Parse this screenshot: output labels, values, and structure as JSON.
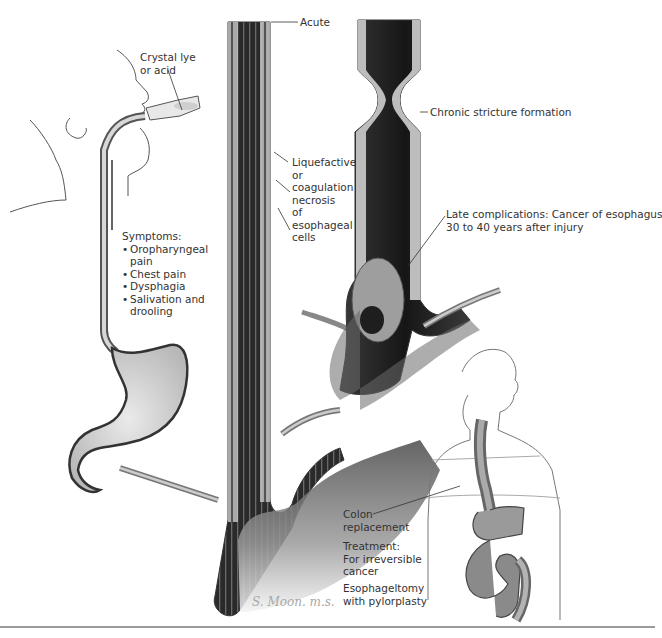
{
  "figure": {
    "labels": {
      "agent": [
        "Crystal lye",
        "or acid"
      ],
      "symptoms_title": "Symptoms:",
      "symptoms": [
        [
          "Oropharyngeal",
          "pain"
        ],
        [
          "Chest pain"
        ],
        [
          "Dysphagia"
        ],
        [
          "Salivation and",
          "drooling"
        ]
      ],
      "acute": "Acute",
      "necrosis": [
        "Liquefactive",
        "or",
        "coagulation",
        "necrosis",
        "of",
        "esophageal",
        "cells"
      ],
      "chronic": "Chronic stricture formation",
      "late": [
        "Late complications: Cancer of esophagus",
        "30 to 40 years after injury"
      ],
      "colon": [
        "Colon",
        "replacement"
      ],
      "treatment": [
        "Treatment:",
        "For irreversible",
        "cancer"
      ],
      "surgery": [
        "Esophageltomy",
        "with pylorplasty"
      ]
    },
    "signature": "S. Moon. m.s.",
    "colors": {
      "ink": "#2a2a2a",
      "tissue_dark": "#3a3a3a",
      "tissue_mid": "#8a8a8a",
      "tissue_light": "#d6d6d6",
      "rule": "#9a9a9a"
    }
  }
}
